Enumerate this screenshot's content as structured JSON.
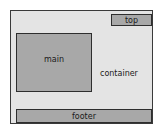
{
  "diagram": {
    "container": {
      "label": "container",
      "fill": "#e4e4e4",
      "border": "#3a3a3a"
    },
    "boxes": {
      "top": {
        "label": "top",
        "fill": "#a8a8a8"
      },
      "main": {
        "label": "main",
        "fill": "#a8a8a8"
      },
      "footer": {
        "label": "footer",
        "fill": "#a8a8a8"
      }
    }
  }
}
